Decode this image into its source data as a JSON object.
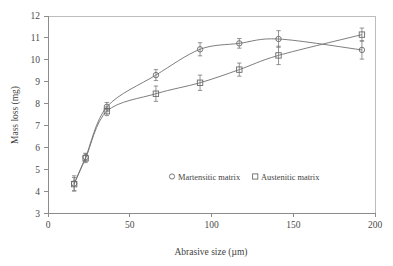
{
  "chart_data": {
    "type": "line",
    "title": "",
    "subtitle": "",
    "xlabel": "Abrasive size (µm)",
    "ylabel": "Mass loss (mg)",
    "xlim": [
      0,
      200
    ],
    "ylim": [
      3,
      12
    ],
    "xticks": [
      0,
      50,
      100,
      150,
      200
    ],
    "yticks": [
      3,
      4,
      5,
      6,
      7,
      8,
      9,
      10,
      11,
      12
    ],
    "xtick_labels": [
      "0",
      "50",
      "100",
      "150",
      "200"
    ],
    "ytick_labels": [
      "3",
      "4",
      "5",
      "6",
      "7",
      "8",
      "9",
      "10",
      "11",
      "12"
    ],
    "grid": false,
    "legend_position": "center",
    "marker_style": "open",
    "series": [
      {
        "name": "Martensitic matrix",
        "marker": "circle",
        "x": [
          16,
          23,
          36,
          66,
          93,
          117,
          141,
          192
        ],
        "values": [
          4.35,
          5.55,
          7.85,
          9.3,
          10.48,
          10.75,
          10.95,
          10.45
        ],
        "yerr": [
          0.35,
          0.18,
          0.2,
          0.25,
          0.3,
          0.22,
          0.38,
          0.42
        ]
      },
      {
        "name": "Austenitic matrix",
        "marker": "square",
        "x": [
          16,
          23,
          36,
          66,
          93,
          117,
          141,
          192
        ],
        "values": [
          4.32,
          5.5,
          7.65,
          8.45,
          8.95,
          9.55,
          10.2,
          11.15
        ],
        "yerr": [
          0.3,
          0.2,
          0.2,
          0.35,
          0.35,
          0.3,
          0.42,
          0.3
        ]
      }
    ]
  },
  "legend": {
    "entries": [
      {
        "marker_name": "open-circle-marker",
        "label": "Martensitic matrix"
      },
      {
        "marker_name": "open-square-marker",
        "label": "Austenitic matrix"
      }
    ]
  },
  "colors": {
    "line": "#6f6f6f",
    "marker": "#6a6a6a",
    "axis": "#8c8c8c",
    "frame": "#bdbdbd",
    "text": "#3f3f3f",
    "background": "#ffffff"
  }
}
